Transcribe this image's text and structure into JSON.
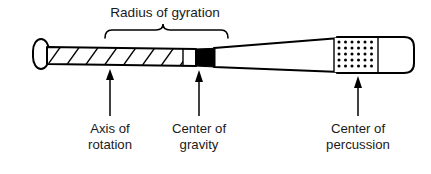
{
  "figure": {
    "type": "diagram",
    "background_color": "#ffffff",
    "stroke_color": "#000000",
    "text_color": "#1a1a1a",
    "top_label": "Radius of gyration",
    "labels": [
      {
        "id": "axis-of-rotation",
        "line1": "Axis of",
        "line2": "rotation",
        "arrow_x": 110
      },
      {
        "id": "center-of-gravity",
        "line1": "Center of",
        "line2": "gravity",
        "arrow_x": 199
      },
      {
        "id": "center-of-percussion",
        "line1": "Center of",
        "line2": "percussion",
        "arrow_x": 358
      }
    ],
    "regions": {
      "knob": "rounded-knob",
      "handle_pattern": "diagonal-hatching",
      "center_of_gravity_marker": "solid-black-block",
      "center_of_percussion_marker": "dotted-grid-panel",
      "barrel_tip": "rounded-end"
    },
    "brace": {
      "left_x": 105,
      "right_x": 228,
      "peak_x": 163,
      "label": "Radius of gyration"
    },
    "dot_grid": {
      "columns": 7,
      "rows": 6
    }
  }
}
